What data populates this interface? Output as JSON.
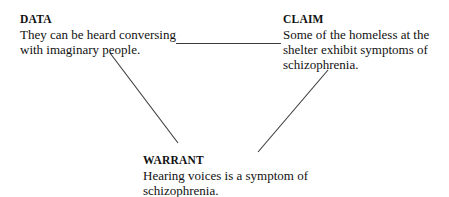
{
  "diagram": {
    "background_color": "#ffffff",
    "line_color": "#3a3a3a",
    "text_color": "#111111",
    "nodes": [
      {
        "id": "data",
        "heading": "DATA",
        "body": "They can be heard conversing with imaginary people."
      },
      {
        "id": "claim",
        "heading": "CLAIM",
        "body": "Some of the homeless at the shelter exhibit symptoms of schizophrenia."
      },
      {
        "id": "warrant",
        "heading": "WARRANT",
        "body": "Hearing voices is a symptom of schizophrenia."
      }
    ],
    "connectors": [
      {
        "id": "data-to-claim",
        "type": "horizontal-line",
        "from": "data",
        "to": "claim"
      },
      {
        "id": "data-to-warrant",
        "type": "diagonal-line",
        "from": "data",
        "to": "warrant"
      },
      {
        "id": "warrant-to-claim",
        "type": "diagonal-line",
        "from": "warrant",
        "to": "claim"
      }
    ]
  }
}
